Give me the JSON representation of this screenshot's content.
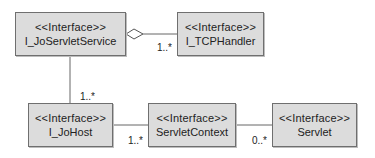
{
  "diagram": {
    "type": "UML class diagram",
    "fill_color": "#dcdcdc",
    "border_color": "#6f6f6f",
    "classes": [
      {
        "id": "joservletservice",
        "stereotype": "<<Interface>>",
        "name": "I_JoServletService"
      },
      {
        "id": "tcphandler",
        "stereotype": "<<Interface>>",
        "name": "I_TCPHandler"
      },
      {
        "id": "johost",
        "stereotype": "<<Interface>>",
        "name": "I_JoHost"
      },
      {
        "id": "servletcontext",
        "stereotype": "<<Interface>>",
        "name": "ServletContext"
      },
      {
        "id": "servlet",
        "stereotype": "<<Interface>>",
        "name": "Servlet"
      }
    ],
    "relations": [
      {
        "from": "I_JoServletService",
        "to": "I_TCPHandler",
        "kind": "aggregation",
        "multiplicity": "1..*"
      },
      {
        "from": "I_JoServletService",
        "to": "I_JoHost",
        "kind": "association",
        "multiplicity": "1..*"
      },
      {
        "from": "I_JoHost",
        "to": "ServletContext",
        "kind": "association",
        "multiplicity": "1..*"
      },
      {
        "from": "ServletContext",
        "to": "Servlet",
        "kind": "association",
        "multiplicity": "0..*"
      }
    ]
  }
}
